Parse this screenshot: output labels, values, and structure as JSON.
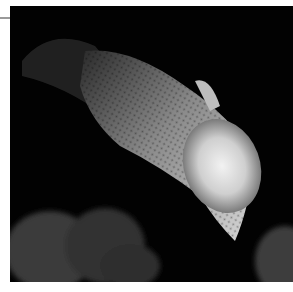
{
  "image": {
    "subject": "fish",
    "description": "Close-up photograph of a fish with speckled, scaled body and fanned tail swimming diagonally down-right against a black background, with blurred coral/rock shapes at the bottom",
    "colors": {
      "background": "#020202",
      "body_light": "#e8e8e8",
      "body_mid": "#9a9a9a",
      "rocks": "#3a3a3a",
      "frame": "#ffffff"
    }
  }
}
